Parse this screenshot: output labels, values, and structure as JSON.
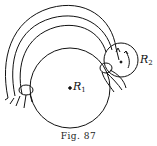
{
  "figure": {
    "caption": "Fig. 87",
    "labels": {
      "r1": {
        "main": "R",
        "sub": "1"
      },
      "r2": {
        "main": "R",
        "sub": "2"
      }
    }
  },
  "colors": {
    "stroke": "#111111",
    "background": "#ffffff"
  }
}
